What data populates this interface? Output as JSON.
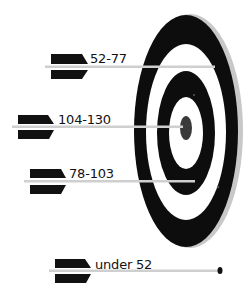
{
  "diagram": {
    "type": "target-with-arrows",
    "colors": {
      "ring_dark": "#0d0d0d",
      "ring_light": "#ffffff",
      "rim": "#c8c8c8",
      "bullseye": "#3a3a3a",
      "shaft": "#cfcfcf",
      "fletching": "#111111"
    },
    "arrows": [
      {
        "label": "52-77",
        "position": "outer white ring (hit)"
      },
      {
        "label": "104-130",
        "position": "bullseye (hit)"
      },
      {
        "label": "78-103",
        "position": "inner white ring (hit)"
      },
      {
        "label": "under 52",
        "position": "miss (below target)"
      }
    ]
  }
}
